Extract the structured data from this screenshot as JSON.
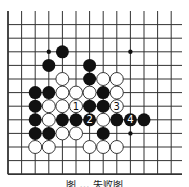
{
  "diagram": {
    "type": "go-board-fragment",
    "grid": {
      "columns": 13,
      "rows": 13,
      "origin_x": 8,
      "origin_y": 11,
      "spacing": 13.6,
      "line_color": "#333333",
      "edge_left": true,
      "edge_bottom": true
    },
    "star_points": [
      [
        3,
        3
      ],
      [
        9,
        3
      ],
      [
        9,
        9
      ]
    ],
    "stones": {
      "black": [
        [
          4,
          3
        ],
        [
          3,
          4
        ],
        [
          6,
          4
        ],
        [
          6,
          5
        ],
        [
          2,
          6
        ],
        [
          3,
          6
        ],
        [
          7,
          6
        ],
        [
          2,
          7
        ],
        [
          6,
          7
        ],
        [
          7,
          7
        ],
        [
          2,
          8
        ],
        [
          4,
          8
        ],
        [
          5,
          8
        ],
        [
          6,
          8
        ],
        [
          8,
          8
        ],
        [
          9,
          8
        ],
        [
          10,
          8
        ],
        [
          2,
          9
        ],
        [
          3,
          9
        ],
        [
          7,
          9
        ]
      ],
      "white": [
        [
          4,
          5
        ],
        [
          7,
          5
        ],
        [
          8,
          5
        ],
        [
          4,
          6
        ],
        [
          5,
          6
        ],
        [
          6,
          6
        ],
        [
          8,
          6
        ],
        [
          3,
          7
        ],
        [
          4,
          7
        ],
        [
          5,
          7
        ],
        [
          8,
          7
        ],
        [
          3,
          8
        ],
        [
          7,
          8
        ],
        [
          4,
          9
        ],
        [
          5,
          9
        ],
        [
          2,
          10
        ],
        [
          3,
          10
        ],
        [
          6,
          10
        ],
        [
          7,
          10
        ],
        [
          8,
          10
        ]
      ]
    },
    "move_labels": [
      {
        "col": 5,
        "row": 7,
        "color": "white",
        "label": "1"
      },
      {
        "col": 6,
        "row": 8,
        "color": "black",
        "label": "2"
      },
      {
        "col": 8,
        "row": 7,
        "color": "white",
        "label": "3"
      },
      {
        "col": 9,
        "row": 8,
        "color": "black",
        "label": "4"
      }
    ],
    "colors": {
      "black_stone": "#111111",
      "white_stone": "#ffffff",
      "stone_outline": "#222222"
    }
  },
  "caption": "图 … 失败图"
}
